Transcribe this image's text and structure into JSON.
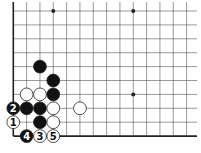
{
  "diagram": {
    "type": "go-board-fragment",
    "corner": "bottom-left",
    "grid": {
      "origin_x": 13.3,
      "origin_y": 11,
      "col_spacing": 13.33,
      "row_spacing": 13.9,
      "cols": 14,
      "rows": 10,
      "left_edge": true,
      "bottom_edge": true,
      "extend_right_to": 197,
      "extend_top_to": 2
    },
    "colors": {
      "line": "#555555",
      "edge": "#222222",
      "black_stone": "#111111",
      "white_stone": "#ffffff",
      "stone_outline": "#222222"
    },
    "star_points": [
      {
        "col": 3,
        "row": 0
      },
      {
        "col": 9,
        "row": 0
      },
      {
        "col": 9,
        "row": 6
      }
    ],
    "stones": [
      {
        "color": "black",
        "col": 2,
        "row": 4,
        "label": ""
      },
      {
        "color": "black",
        "col": 3,
        "row": 5,
        "label": ""
      },
      {
        "color": "white",
        "col": 1,
        "row": 6,
        "label": ""
      },
      {
        "color": "white",
        "col": 2,
        "row": 6,
        "label": ""
      },
      {
        "color": "black",
        "col": 3,
        "row": 6,
        "label": ""
      },
      {
        "color": "black",
        "col": 0,
        "row": 7,
        "label": "2"
      },
      {
        "color": "black",
        "col": 1,
        "row": 7,
        "label": ""
      },
      {
        "color": "black",
        "col": 2,
        "row": 7,
        "label": ""
      },
      {
        "color": "white",
        "col": 3,
        "row": 7,
        "label": ""
      },
      {
        "color": "white",
        "col": 5,
        "row": 7,
        "label": ""
      },
      {
        "color": "white",
        "col": 0,
        "row": 8,
        "label": "1"
      },
      {
        "color": "black",
        "col": 2,
        "row": 8,
        "label": ""
      },
      {
        "color": "white",
        "col": 3,
        "row": 8,
        "label": ""
      },
      {
        "color": "black",
        "col": 1,
        "row": 9,
        "label": "4"
      },
      {
        "color": "white",
        "col": 2,
        "row": 9,
        "label": "3"
      },
      {
        "color": "white",
        "col": 3,
        "row": 9,
        "label": "5"
      }
    ]
  }
}
